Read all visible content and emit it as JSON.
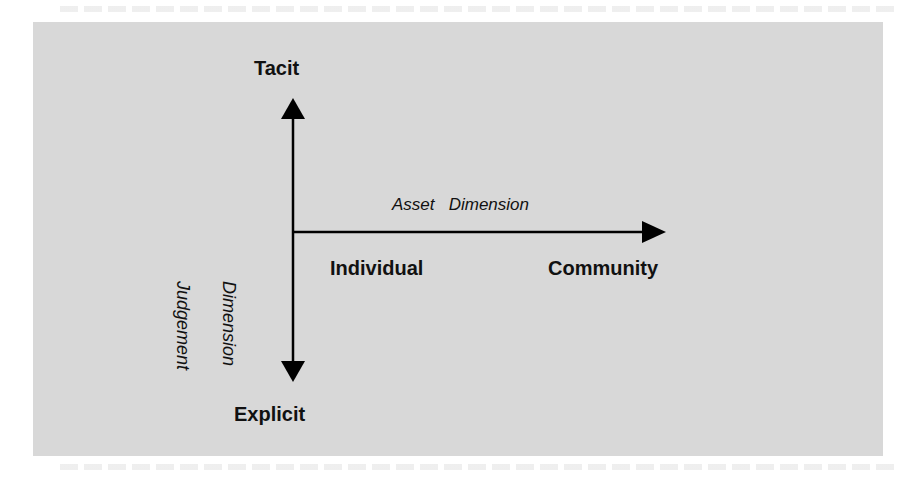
{
  "diagram": {
    "type": "two-axis knowledge matrix",
    "vertical_axis": {
      "name_line1": "Judgement",
      "name_line2": "Dimension",
      "top_label": "Tacit",
      "bottom_label": "Explicit"
    },
    "horizontal_axis": {
      "name": "Asset   Dimension",
      "left_label": "Individual",
      "right_label": "Community"
    },
    "colors": {
      "panel": "#d8d8d8",
      "lines": "#000000",
      "text": "#111111"
    }
  }
}
